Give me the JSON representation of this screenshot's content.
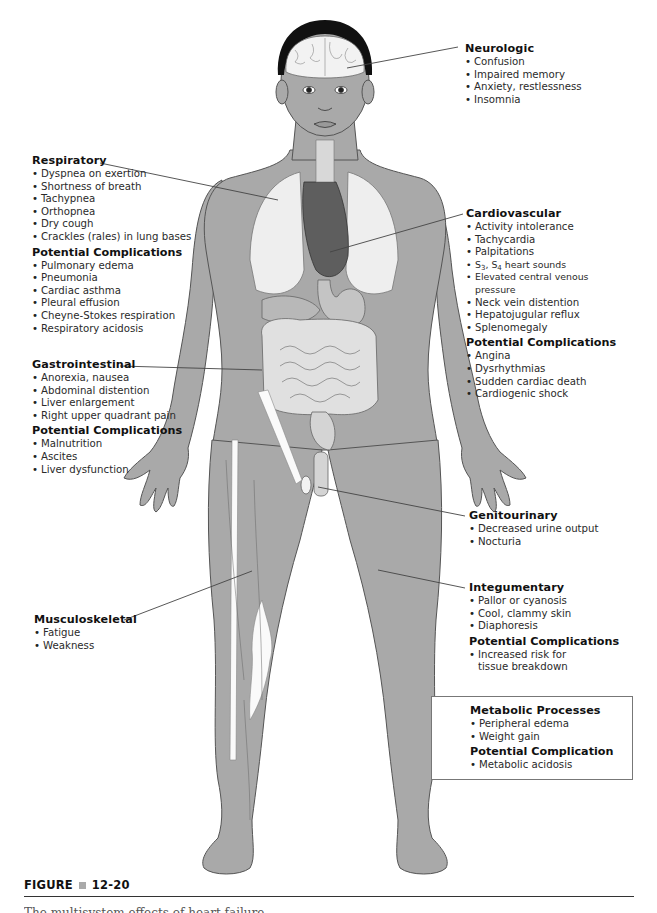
{
  "figure": {
    "label": "FIGURE",
    "number": "12-20",
    "caption_partial": "The multisystem effects of heart failure."
  },
  "panels": {
    "neurologic": {
      "title": "Neurologic",
      "items": [
        "Confusion",
        "Impaired memory",
        "Anxiety, restlessness",
        "Insomnia"
      ]
    },
    "respiratory": {
      "title": "Respiratory",
      "items": [
        "Dyspnea on exertion",
        "Shortness of breath",
        "Tachypnea",
        "Orthopnea",
        "Dry cough",
        "Crackles (rales) in lung bases"
      ],
      "complications_title": "Potential Complications",
      "complications": [
        "Pulmonary edema",
        "Pneumonia",
        "Cardiac asthma",
        "Pleural effusion",
        "Cheyne-Stokes respiration",
        "Respiratory acidosis"
      ]
    },
    "cardiovascular": {
      "title": "Cardiovascular",
      "items": [
        "Activity intolerance",
        "Tachycardia",
        "Palpitations"
      ],
      "heart_sounds": {
        "s": "S",
        "s3": "3",
        "sep": ", ",
        "s4": "4",
        "rest": " heart sounds"
      },
      "items2": [
        "Elevated central venous pressure",
        "Neck vein distention",
        "Hepatojugular reflux",
        "Splenomegaly"
      ],
      "complications_title": "Potential Complications",
      "complications": [
        "Angina",
        "Dysrhythmias",
        "Sudden cardiac death",
        "Cardiogenic shock"
      ]
    },
    "gastrointestinal": {
      "title": "Gastrointestinal",
      "items": [
        "Anorexia, nausea",
        "Abdominal distention",
        "Liver enlargement",
        "Right upper quadrant pain"
      ],
      "complications_title": "Potential Complications",
      "complications": [
        "Malnutrition",
        "Ascites",
        "Liver dysfunction"
      ]
    },
    "genitourinary": {
      "title": "Genitourinary",
      "items": [
        "Decreased urine output",
        "Nocturia"
      ]
    },
    "integumentary": {
      "title": "Integumentary",
      "items": [
        "Pallor or cyanosis",
        "Cool, clammy skin",
        "Diaphoresis"
      ],
      "complications_title": "Potential Complications",
      "complications": [
        "Increased risk for tissue breakdown"
      ]
    },
    "musculoskeletal": {
      "title": "Musculoskeletal",
      "items": [
        "Fatigue",
        "Weakness"
      ]
    },
    "metabolic": {
      "title": "Metabolic Processes",
      "items": [
        "Peripheral edema",
        "Weight gain"
      ],
      "complications_title": "Potential Complication",
      "complications": [
        "Metabolic acidosis"
      ]
    }
  },
  "colors": {
    "skin": "#a9a9a9",
    "skin_outline": "#555555",
    "organ_light": "#e6e6e6",
    "organ_dark": "#5a5a5a",
    "hair": "#111111",
    "leader_line": "#444444"
  }
}
